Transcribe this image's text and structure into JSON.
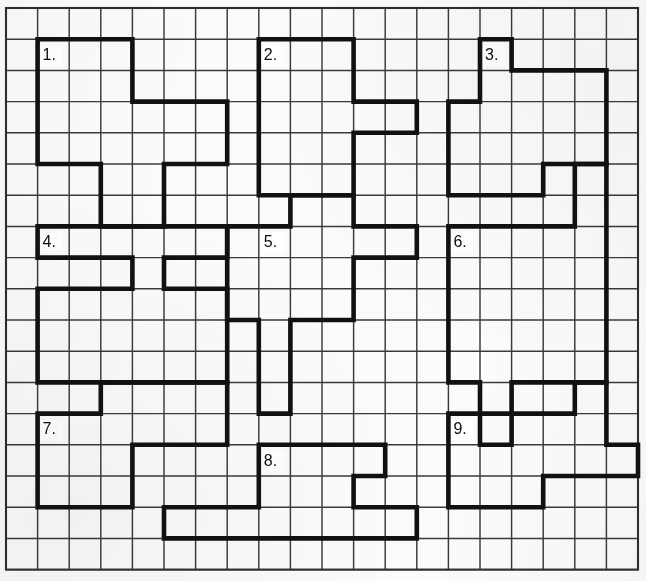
{
  "page": {
    "background_color": "#fbfbf9",
    "grid_line_color": "#3a3a3a",
    "outline_color": "#111111",
    "label_color": "#0d0d0d"
  },
  "grid": {
    "origin_x": 6,
    "origin_y": 8,
    "cols": 20,
    "rows": 18,
    "cell_width": 31.6,
    "cell_height": 31.2,
    "thin_stroke": 1.45,
    "thick_stroke": 4.6,
    "frame_stroke": 2.1
  },
  "chart_data": {
    "type": "diagram",
    "grid_cols": 20,
    "grid_rows": 18,
    "shapes": [
      {
        "number": 1,
        "label": "1.",
        "label_cell": [
          1,
          1
        ],
        "points": [
          [
            1,
            1
          ],
          [
            4,
            1
          ],
          [
            4,
            3
          ],
          [
            7,
            3
          ],
          [
            7,
            5
          ],
          [
            5,
            5
          ],
          [
            5,
            7
          ],
          [
            3,
            7
          ],
          [
            3,
            5
          ],
          [
            1,
            5
          ]
        ],
        "area_cells": 18
      },
      {
        "number": 2,
        "label": "2.",
        "label_cell": [
          8,
          1
        ],
        "points": [
          [
            8,
            1
          ],
          [
            11,
            1
          ],
          [
            11,
            3
          ],
          [
            13,
            3
          ],
          [
            13,
            4
          ],
          [
            11,
            4
          ],
          [
            11,
            6
          ],
          [
            8,
            6
          ]
        ],
        "area_cells": 17
      },
      {
        "number": 3,
        "label": "3.",
        "label_cell": [
          15,
          1
        ],
        "points": [
          [
            15,
            1
          ],
          [
            16,
            1
          ],
          [
            16,
            2
          ],
          [
            19,
            2
          ],
          [
            19,
            5
          ],
          [
            17,
            5
          ],
          [
            17,
            6
          ],
          [
            14,
            6
          ],
          [
            14,
            3
          ],
          [
            15,
            3
          ]
        ],
        "area_cells": 18
      },
      {
        "number": 4,
        "label": "4.",
        "label_cell": [
          1,
          7
        ],
        "points": [
          [
            1,
            7
          ],
          [
            7,
            7
          ],
          [
            7,
            8
          ],
          [
            5,
            8
          ],
          [
            5,
            9
          ],
          [
            7,
            9
          ],
          [
            7,
            12
          ],
          [
            1,
            12
          ],
          [
            1,
            9
          ],
          [
            4,
            9
          ],
          [
            4,
            8
          ],
          [
            1,
            8
          ]
        ],
        "area_cells": 22
      },
      {
        "number": 5,
        "label": "5.",
        "label_cell": [
          8,
          7
        ],
        "points": [
          [
            9,
            6
          ],
          [
            11,
            6
          ],
          [
            11,
            7
          ],
          [
            13,
            7
          ],
          [
            13,
            8
          ],
          [
            11,
            8
          ],
          [
            11,
            10
          ],
          [
            9,
            10
          ],
          [
            9,
            13
          ],
          [
            8,
            13
          ],
          [
            8,
            10
          ],
          [
            7,
            10
          ],
          [
            7,
            7
          ],
          [
            9,
            7
          ]
        ],
        "area_cells": 20
      },
      {
        "number": 6,
        "label": "6.",
        "label_cell": [
          14,
          7
        ],
        "points": [
          [
            18,
            5
          ],
          [
            19,
            5
          ],
          [
            19,
            12
          ],
          [
            16,
            12
          ],
          [
            16,
            14
          ],
          [
            15,
            14
          ],
          [
            15,
            12
          ],
          [
            14,
            12
          ],
          [
            14,
            7
          ],
          [
            18,
            7
          ]
        ],
        "area_cells": 25
      },
      {
        "number": 7,
        "label": "7.",
        "label_cell": [
          1,
          13
        ],
        "points": [
          [
            3,
            12
          ],
          [
            7,
            12
          ],
          [
            7,
            14
          ],
          [
            4,
            14
          ],
          [
            4,
            16
          ],
          [
            1,
            16
          ],
          [
            1,
            13
          ],
          [
            3,
            13
          ]
        ],
        "area_cells": 17
      },
      {
        "number": 8,
        "label": "8.",
        "label_cell": [
          8,
          14
        ],
        "points": [
          [
            8,
            14
          ],
          [
            12,
            14
          ],
          [
            12,
            15
          ],
          [
            11,
            15
          ],
          [
            11,
            16
          ],
          [
            13,
            16
          ],
          [
            13,
            17
          ],
          [
            5,
            17
          ],
          [
            5,
            16
          ],
          [
            8,
            16
          ]
        ],
        "area_cells": 18
      },
      {
        "number": 9,
        "label": "9.",
        "label_cell": [
          14,
          13
        ],
        "points": [
          [
            18,
            12
          ],
          [
            19,
            12
          ],
          [
            19,
            14
          ],
          [
            20,
            14
          ],
          [
            20,
            15
          ],
          [
            17,
            15
          ],
          [
            17,
            16
          ],
          [
            14,
            16
          ],
          [
            14,
            13
          ],
          [
            18,
            13
          ]
        ],
        "area_cells": 18
      }
    ]
  }
}
